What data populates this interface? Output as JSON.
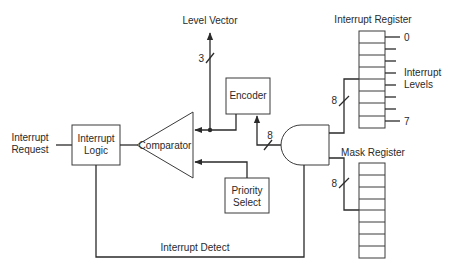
{
  "diagram": {
    "type": "block-diagram",
    "colors": {
      "line": "#2a2a2a",
      "background": "#ffffff"
    },
    "labels": {
      "interrupt_request_l1": "Interrupt",
      "interrupt_request_l2": "Request",
      "interrupt_logic_l1": "Interrupt",
      "interrupt_logic_l2": "Logic",
      "comparator": "Comparator",
      "encoder": "Encoder",
      "priority_select_l1": "Priority",
      "priority_select_l2": "Select",
      "level_vector": "Level Vector",
      "interrupt_register": "Interrupt Register",
      "mask_register": "Mask Register",
      "interrupt_levels_l1": "Interrupt",
      "interrupt_levels_l2": "Levels",
      "level_0": "0",
      "level_7": "7",
      "interrupt_detect": "Interrupt Detect",
      "bus_width_level_vector": "3",
      "bus_width_encoder": "8",
      "bus_width_interrupt_register": "8",
      "bus_width_mask_register": "8"
    },
    "components": [
      "Interrupt Logic",
      "Comparator",
      "Encoder",
      "Priority Select",
      "AND gate",
      "Interrupt Register (8 bits)",
      "Mask Register (8 bits)"
    ]
  }
}
